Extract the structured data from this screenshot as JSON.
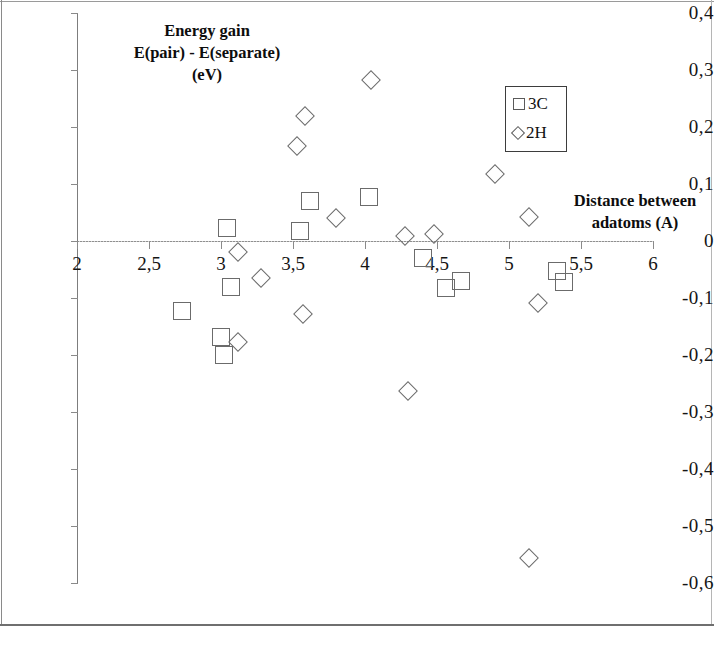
{
  "chart_data": {
    "type": "scatter",
    "title": "",
    "ylabel": "Energy gain\nE(pair) - E(separate)\n(eV)",
    "ylabel_lines": [
      "Energy gain",
      "E(pair) - E(separate)",
      "(eV)"
    ],
    "xlabel": "Distance between adatoms (A)",
    "xlabel_lines": [
      "Distance between",
      "adatoms (A)"
    ],
    "xlim": [
      2,
      6
    ],
    "ylim": [
      -0.6,
      0.4
    ],
    "xticks": [
      2,
      2.5,
      3,
      3.5,
      4,
      4.5,
      5,
      5.5,
      6
    ],
    "xtick_labels": [
      "2",
      "2,5",
      "3",
      "3,5",
      "4",
      "4,5",
      "5",
      "5,5",
      "6"
    ],
    "yticks": [
      0.4,
      0.3,
      0.2,
      0.1,
      0,
      -0.1,
      -0.2,
      -0.3,
      -0.4,
      -0.5,
      -0.6
    ],
    "ytick_labels": [
      "0,4",
      "0,3",
      "0,2",
      "0,1",
      "0",
      "-0,1",
      "-0,2",
      "-0,3",
      "-0,4",
      "-0,5",
      "-0,6"
    ],
    "grid": false,
    "legend_position": "upper right",
    "marker_color": "#6b6b6b",
    "axis_color": "#8a8a8a",
    "series": [
      {
        "name": "3C",
        "marker": "square",
        "points": [
          [
            2.73,
            -0.122
          ],
          [
            3.04,
            0.022
          ],
          [
            3.07,
            -0.08
          ],
          [
            3.0,
            -0.168
          ],
          [
            3.02,
            -0.2
          ],
          [
            3.55,
            0.017
          ],
          [
            3.62,
            0.071
          ],
          [
            4.03,
            0.078
          ],
          [
            4.4,
            -0.03
          ],
          [
            4.56,
            -0.082
          ],
          [
            4.67,
            -0.07
          ],
          [
            5.33,
            -0.052
          ],
          [
            5.38,
            -0.072
          ]
        ]
      },
      {
        "name": "2H",
        "marker": "diamond",
        "points": [
          [
            3.12,
            -0.02
          ],
          [
            3.12,
            -0.178
          ],
          [
            3.28,
            -0.065
          ],
          [
            3.58,
            0.22
          ],
          [
            3.53,
            0.167
          ],
          [
            3.57,
            -0.128
          ],
          [
            3.8,
            0.04
          ],
          [
            4.04,
            0.282
          ],
          [
            4.3,
            -0.263
          ],
          [
            4.28,
            0.009
          ],
          [
            4.48,
            0.012
          ],
          [
            4.9,
            0.117
          ],
          [
            5.14,
            0.042
          ],
          [
            5.2,
            -0.108
          ],
          [
            5.14,
            -0.556
          ]
        ]
      }
    ]
  },
  "legend": {
    "entries": [
      {
        "label": "3C",
        "marker": "square"
      },
      {
        "label": "2H",
        "marker": "diamond"
      }
    ]
  }
}
